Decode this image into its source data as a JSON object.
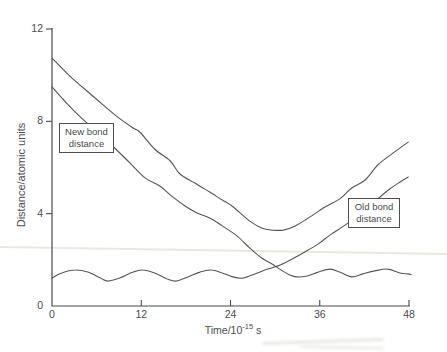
{
  "figure": {
    "width": 447,
    "height": 352,
    "bg": "#ffffff",
    "ink": "#565656",
    "axis_color": "#4a4a4a",
    "text_color": "#4c4c4c",
    "artifact_color": "#e9e9e4"
  },
  "chart_data": {
    "type": "line",
    "title": "",
    "xlabel_parts": {
      "prefix": "Time/10",
      "exponent": "-15",
      "suffix": " s"
    },
    "ylabel": "Distance/atomic units",
    "xlim": [
      0,
      48
    ],
    "ylim": [
      0,
      12
    ],
    "grid": false,
    "x_ticks": {
      "values": [
        0,
        12,
        24,
        36,
        48
      ],
      "labels": [
        "0",
        "12",
        "24",
        "36",
        "48"
      ]
    },
    "y_ticks": {
      "values": [
        0,
        4,
        8,
        12
      ],
      "labels": [
        "0",
        "4",
        "8",
        "12"
      ]
    },
    "annotations": [
      {
        "id": "new-bond-label",
        "lines": [
          "New bond",
          "distance"
        ],
        "box_px": {
          "left": 59,
          "top": 123,
          "width": 55,
          "height": 30
        }
      },
      {
        "id": "old-bond-label",
        "lines": [
          "Old bond",
          "distance"
        ],
        "box_px": {
          "left": 348,
          "top": 198,
          "width": 52,
          "height": 30
        }
      }
    ],
    "series": [
      {
        "id": "upper-unlabeled-curve",
        "points": [
          [
            0,
            10.74
          ],
          [
            2.4,
            9.96
          ],
          [
            5.8,
            9.01
          ],
          [
            8.5,
            8.27
          ],
          [
            10.9,
            7.71
          ],
          [
            11.8,
            7.54
          ],
          [
            13.8,
            6.8
          ],
          [
            15.9,
            6.28
          ],
          [
            17.2,
            5.72
          ],
          [
            19.2,
            5.33
          ],
          [
            21.2,
            4.94
          ],
          [
            22.9,
            4.59
          ],
          [
            24.2,
            4.33
          ],
          [
            26.6,
            3.68
          ],
          [
            28.2,
            3.38
          ],
          [
            29.6,
            3.29
          ],
          [
            31.1,
            3.29
          ],
          [
            32.7,
            3.47
          ],
          [
            34.7,
            3.86
          ],
          [
            36.7,
            4.29
          ],
          [
            38.7,
            4.64
          ],
          [
            40.3,
            5.11
          ],
          [
            42.1,
            5.46
          ],
          [
            43.8,
            6.11
          ],
          [
            45.7,
            6.59
          ],
          [
            47.9,
            7.1
          ]
        ]
      },
      {
        "id": "new-bond-distance",
        "label_ref": "new-bond-label",
        "points": [
          [
            0,
            9.49
          ],
          [
            1.7,
            8.88
          ],
          [
            3.8,
            8.19
          ],
          [
            6.5,
            7.41
          ],
          [
            8.7,
            6.76
          ],
          [
            10.5,
            6.19
          ],
          [
            12.5,
            5.55
          ],
          [
            14.5,
            5.2
          ],
          [
            16.1,
            4.76
          ],
          [
            17.9,
            4.33
          ],
          [
            19.5,
            4.03
          ],
          [
            21.2,
            3.81
          ],
          [
            22.9,
            3.47
          ],
          [
            24.9,
            3.03
          ],
          [
            26.6,
            2.51
          ],
          [
            28.2,
            2.08
          ],
          [
            29.6,
            1.82
          ],
          [
            30.8,
            1.56
          ],
          [
            32,
            1.34
          ],
          [
            32.9,
            1.26
          ],
          [
            34.3,
            1.3
          ],
          [
            35.8,
            1.47
          ],
          [
            37.4,
            1.6
          ],
          [
            38.7,
            1.47
          ],
          [
            40.3,
            1.26
          ],
          [
            41.8,
            1.39
          ],
          [
            43.4,
            1.52
          ],
          [
            45.2,
            1.6
          ],
          [
            46.8,
            1.43
          ],
          [
            47.9,
            1.39
          ],
          [
            48.3,
            1.35
          ]
        ]
      },
      {
        "id": "old-bond-distance",
        "label_ref": "old-bond-label",
        "points": [
          [
            0,
            1.21
          ],
          [
            1.3,
            1.43
          ],
          [
            3.1,
            1.56
          ],
          [
            4.8,
            1.47
          ],
          [
            6.5,
            1.21
          ],
          [
            7.5,
            1.08
          ],
          [
            9.1,
            1.21
          ],
          [
            10.9,
            1.47
          ],
          [
            12.2,
            1.56
          ],
          [
            13.8,
            1.43
          ],
          [
            15.5,
            1.17
          ],
          [
            16.7,
            1.08
          ],
          [
            18.3,
            1.26
          ],
          [
            19.9,
            1.47
          ],
          [
            21.4,
            1.56
          ],
          [
            22.9,
            1.43
          ],
          [
            24.3,
            1.26
          ],
          [
            25.7,
            1.21
          ],
          [
            27.3,
            1.39
          ],
          [
            29,
            1.6
          ],
          [
            30.7,
            1.78
          ],
          [
            32.3,
            2.04
          ],
          [
            34,
            2.34
          ],
          [
            35.8,
            2.69
          ],
          [
            37.4,
            3.08
          ],
          [
            39,
            3.42
          ],
          [
            40.6,
            3.77
          ],
          [
            42.2,
            4.2
          ],
          [
            43.8,
            4.64
          ],
          [
            45.4,
            5.07
          ],
          [
            46.8,
            5.37
          ],
          [
            47.9,
            5.59
          ]
        ]
      }
    ],
    "layout_px": {
      "x_axis_y": 306,
      "y_axis_x": 52,
      "x_axis_end": 410,
      "y_axis_top": 28,
      "px_per_time_unit": 7.4375,
      "px_per_distance_unit": 23.0833
    }
  }
}
